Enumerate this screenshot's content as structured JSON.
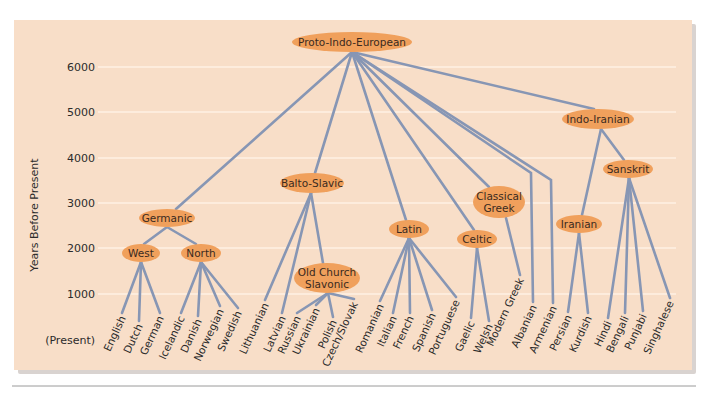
{
  "chart": {
    "title": "",
    "ylabel": "Years Before Present",
    "present_label": "(Present)",
    "yticks": [
      {
        "label": "6000",
        "y": 67
      },
      {
        "label": "5000",
        "y": 112
      },
      {
        "label": "4000",
        "y": 158
      },
      {
        "label": "3000",
        "y": 203
      },
      {
        "label": "2000",
        "y": 248
      },
      {
        "label": "1000",
        "y": 294
      }
    ]
  },
  "colors": {
    "panel": "#F8DEC8",
    "node": "#F0A05C",
    "edge": "#8796B4",
    "grid": "#FFF1E4"
  },
  "nodes": [
    {
      "id": "pie",
      "lines": [
        "Proto-Indo-European"
      ],
      "cx": 352,
      "cy": 42,
      "rx": 60,
      "ry": 10,
      "anchor": [
        352,
        52
      ]
    },
    {
      "id": "germanic",
      "lines": [
        "Germanic"
      ],
      "cx": 167,
      "cy": 218,
      "rx": 28,
      "ry": 9,
      "anchor": [
        167,
        227
      ],
      "top": [
        176,
        209
      ]
    },
    {
      "id": "west",
      "lines": [
        "West"
      ],
      "cx": 141,
      "cy": 253,
      "rx": 19,
      "ry": 9,
      "anchor": [
        141,
        262
      ],
      "top": [
        144,
        244
      ]
    },
    {
      "id": "north",
      "lines": [
        "North"
      ],
      "cx": 201,
      "cy": 253,
      "rx": 20,
      "ry": 9,
      "anchor": [
        201,
        262
      ],
      "top": [
        196,
        244
      ]
    },
    {
      "id": "balto_slavic",
      "lines": [
        "Balto-Slavic"
      ],
      "cx": 312,
      "cy": 183,
      "rx": 32,
      "ry": 10,
      "anchor": [
        311,
        193
      ],
      "top": [
        315,
        173
      ]
    },
    {
      "id": "old_church_slavonic",
      "lines": [
        "Old Church",
        "Slavonic"
      ],
      "cx": 327,
      "cy": 278,
      "rx": 33,
      "ry": 15,
      "anchor": [
        328,
        293
      ],
      "top": [
        323,
        263
      ]
    },
    {
      "id": "latin",
      "lines": [
        "Latin"
      ],
      "cx": 409,
      "cy": 229,
      "rx": 20,
      "ry": 9,
      "anchor": [
        409,
        238
      ],
      "top": [
        406,
        220
      ]
    },
    {
      "id": "celtic",
      "lines": [
        "Celtic"
      ],
      "cx": 477,
      "cy": 239,
      "rx": 20,
      "ry": 9,
      "anchor": [
        477,
        248
      ],
      "top": [
        474,
        230
      ]
    },
    {
      "id": "classical_greek",
      "lines": [
        "Classical",
        "Greek"
      ],
      "cx": 499,
      "cy": 202,
      "rx": 26,
      "ry": 16,
      "anchor": [
        506,
        218
      ],
      "top": [
        489,
        187
      ]
    },
    {
      "id": "indo_iranian",
      "lines": [
        "Indo-Iranian"
      ],
      "cx": 598,
      "cy": 119,
      "rx": 36,
      "ry": 10,
      "anchor": [
        601,
        129
      ],
      "top": [
        594,
        109
      ]
    },
    {
      "id": "sanskrit",
      "lines": [
        "Sanskrit"
      ],
      "cx": 628,
      "cy": 169,
      "rx": 25,
      "ry": 9,
      "anchor": [
        629,
        178
      ],
      "top": [
        624,
        160
      ]
    },
    {
      "id": "iranian",
      "lines": [
        "Iranian"
      ],
      "cx": 579,
      "cy": 224,
      "rx": 23,
      "ry": 9,
      "anchor": [
        579,
        233
      ],
      "top": [
        582,
        215
      ]
    }
  ],
  "branches": [
    {
      "from": "pie",
      "to": "germanic"
    },
    {
      "from": "pie",
      "to": "balto_slavic"
    },
    {
      "from": "pie",
      "to": "latin"
    },
    {
      "from": "pie",
      "to": "celtic"
    },
    {
      "from": "pie",
      "to": "classical_greek"
    },
    {
      "from": "pie",
      "to": "indo_iranian"
    },
    {
      "from": "germanic",
      "to": "west"
    },
    {
      "from": "germanic",
      "to": "north"
    },
    {
      "from": "balto_slavic",
      "to": "old_church_slavonic"
    },
    {
      "from": "indo_iranian",
      "to": "sanskrit"
    },
    {
      "from": "indo_iranian",
      "to": "iranian"
    }
  ],
  "leaves": [
    {
      "label": "English",
      "parent": "west",
      "x": 122,
      "y": 313
    },
    {
      "label": "Dutch",
      "parent": "west",
      "x": 139,
      "y": 321
    },
    {
      "label": "German",
      "parent": "west",
      "x": 160,
      "y": 313
    },
    {
      "label": "Icelandic",
      "parent": "north",
      "x": 181,
      "y": 313
    },
    {
      "label": "Danish",
      "parent": "north",
      "x": 198,
      "y": 316
    },
    {
      "label": "Norwegian",
      "parent": "north",
      "x": 220,
      "y": 306
    },
    {
      "label": "Swedish",
      "parent": "north",
      "x": 238,
      "y": 308
    },
    {
      "label": "Lithuanian",
      "parent": "balto_slavic",
      "x": 265,
      "y": 300
    },
    {
      "label": "Latvian",
      "parent": "balto_slavic",
      "x": 282,
      "y": 313
    },
    {
      "label": "Russian",
      "parent": "old_church_slavonic",
      "x": 297,
      "y": 313
    },
    {
      "label": "Ukrainian",
      "parent": "old_church_slavonic",
      "x": 316,
      "y": 305
    },
    {
      "label": "Polish",
      "parent": "old_church_slavonic",
      "x": 333,
      "y": 317
    },
    {
      "label": "Czech/Slovak",
      "parent": "old_church_slavonic",
      "x": 354,
      "y": 299
    },
    {
      "label": "Romanian",
      "parent": "latin",
      "x": 380,
      "y": 301
    },
    {
      "label": "Italian",
      "parent": "latin",
      "x": 393,
      "y": 313
    },
    {
      "label": "French",
      "parent": "latin",
      "x": 410,
      "y": 313
    },
    {
      "label": "Spanish",
      "parent": "latin",
      "x": 432,
      "y": 310
    },
    {
      "label": "Portuguese",
      "parent": "latin",
      "x": 456,
      "y": 297
    },
    {
      "label": "Gaelic",
      "parent": "celtic",
      "x": 471,
      "y": 318
    },
    {
      "label": "Welsh",
      "parent": "celtic",
      "x": 489,
      "y": 321
    },
    {
      "label": "Modern Greek",
      "parent": "classical_greek",
      "x": 520,
      "y": 275
    },
    {
      "label": "Albanian",
      "parent": "pie",
      "x": 533,
      "y": 302,
      "bend": [
        531,
        173
      ]
    },
    {
      "label": "Armenian",
      "parent": "pie",
      "x": 553,
      "y": 303,
      "bend": [
        551,
        180
      ]
    },
    {
      "label": "Persian",
      "parent": "iranian",
      "x": 568,
      "y": 312
    },
    {
      "label": "Kurdish",
      "parent": "iranian",
      "x": 588,
      "y": 313
    },
    {
      "label": "Hindi",
      "parent": "sanskrit",
      "x": 608,
      "y": 318
    },
    {
      "label": "Bengali",
      "parent": "sanskrit",
      "x": 625,
      "y": 313
    },
    {
      "label": "Punjabi",
      "parent": "sanskrit",
      "x": 643,
      "y": 311
    },
    {
      "label": "Singhalese",
      "parent": "sanskrit",
      "x": 670,
      "y": 298
    }
  ],
  "chart_data": {
    "type": "tree",
    "title": "",
    "xlabel": "",
    "ylabel": "Years Before Present",
    "ylim": [
      0,
      6500
    ],
    "yticks": [
      "(Present)",
      "1000",
      "2000",
      "3000",
      "4000",
      "5000",
      "6000"
    ],
    "grid": true,
    "root": {
      "name": "Proto-Indo-European",
      "years_bp": 6400,
      "children": [
        {
          "name": "Germanic",
          "years_bp": 2650,
          "children": [
            {
              "name": "West",
              "years_bp": 1900,
              "children": [
                {
                  "name": "English"
                },
                {
                  "name": "Dutch"
                },
                {
                  "name": "German"
                }
              ]
            },
            {
              "name": "North",
              "years_bp": 1900,
              "children": [
                {
                  "name": "Icelandic"
                },
                {
                  "name": "Danish"
                },
                {
                  "name": "Norwegian"
                },
                {
                  "name": "Swedish"
                }
              ]
            }
          ]
        },
        {
          "name": "Balto-Slavic",
          "years_bp": 3400,
          "children": [
            {
              "name": "Lithuanian"
            },
            {
              "name": "Latvian"
            },
            {
              "name": "Old Church Slavonic",
              "years_bp": 1300,
              "children": [
                {
                  "name": "Russian"
                },
                {
                  "name": "Ukrainian"
                },
                {
                  "name": "Polish"
                },
                {
                  "name": "Czech/Slovak"
                }
              ]
            }
          ]
        },
        {
          "name": "Latin",
          "years_bp": 2450,
          "children": [
            {
              "name": "Romanian"
            },
            {
              "name": "Italian"
            },
            {
              "name": "French"
            },
            {
              "name": "Spanish"
            },
            {
              "name": "Portuguese"
            }
          ]
        },
        {
          "name": "Celtic",
          "years_bp": 2200,
          "children": [
            {
              "name": "Gaelic"
            },
            {
              "name": "Welsh"
            }
          ]
        },
        {
          "name": "Classical Greek",
          "years_bp": 3000,
          "children": [
            {
              "name": "Modern Greek"
            }
          ]
        },
        {
          "name": "Albanian"
        },
        {
          "name": "Armenian"
        },
        {
          "name": "Indo-Iranian",
          "years_bp": 4900,
          "children": [
            {
              "name": "Sanskrit",
              "years_bp": 3700,
              "children": [
                {
                  "name": "Hindi"
                },
                {
                  "name": "Bengali"
                },
                {
                  "name": "Punjabi"
                },
                {
                  "name": "Singhalese"
                }
              ]
            },
            {
              "name": "Iranian",
              "years_bp": 2550,
              "children": [
                {
                  "name": "Persian"
                },
                {
                  "name": "Kurdish"
                }
              ]
            }
          ]
        }
      ]
    }
  }
}
